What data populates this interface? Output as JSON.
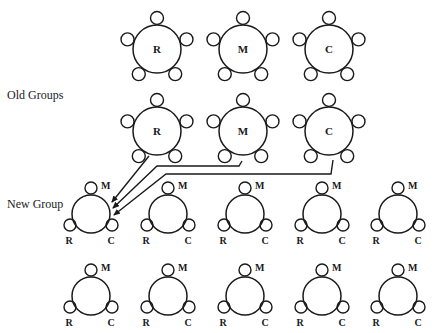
{
  "labels": {
    "old_groups": "Old Groups",
    "new_group": "New Group"
  },
  "colors": {
    "stroke": "#1a1a1a",
    "background": "#ffffff"
  },
  "top_row": [
    {
      "label": "R",
      "cx": 157,
      "cy": 49
    },
    {
      "label": "M",
      "cx": 243,
      "cy": 49
    },
    {
      "label": "C",
      "cx": 329,
      "cy": 49
    }
  ],
  "old_groups": [
    {
      "label": "R",
      "cx": 157,
      "cy": 131
    },
    {
      "label": "M",
      "cx": 243,
      "cy": 131
    },
    {
      "label": "C",
      "cx": 329,
      "cy": 131
    }
  ],
  "new_groups": {
    "member_labels": {
      "top": "M",
      "left": "R",
      "right": "C"
    },
    "rows": [
      {
        "cy": 214,
        "centers_x": [
          91,
          168,
          245,
          322,
          398
        ]
      },
      {
        "cy": 296,
        "centers_x": [
          91,
          168,
          245,
          322,
          398
        ]
      }
    ]
  },
  "arrows": [
    {
      "from": "R",
      "points": [
        [
          149,
          156
        ],
        [
          112,
          202
        ]
      ]
    },
    {
      "from": "M",
      "points": [
        [
          242,
          161
        ],
        [
          239,
          166
        ],
        [
          157,
          166
        ],
        [
          113,
          208
        ]
      ]
    },
    {
      "from": "C",
      "points": [
        [
          333,
          160
        ],
        [
          331,
          174
        ],
        [
          166,
          174
        ],
        [
          114,
          215
        ]
      ]
    }
  ]
}
